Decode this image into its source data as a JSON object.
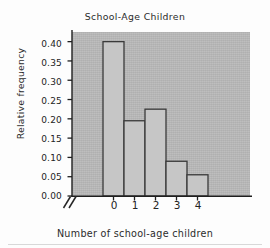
{
  "chart_data": {
    "type": "bar",
    "title": "School-Age Children",
    "xlabel": "Number of school-age children",
    "ylabel": "Relative frequency",
    "categories": [
      "0",
      "1",
      "2",
      "3",
      "4"
    ],
    "values": [
      0.4,
      0.195,
      0.225,
      0.09,
      0.055
    ],
    "ylim": [
      0.0,
      0.425
    ],
    "yticks": [
      "0.00",
      "0.05",
      "0.10",
      "0.15",
      "0.20",
      "0.25",
      "0.30",
      "0.35",
      "0.40"
    ],
    "ytick_values": [
      0.0,
      0.05,
      0.1,
      0.15,
      0.2,
      0.25,
      0.3,
      0.35,
      0.4
    ],
    "xticks": [
      "0",
      "1",
      "2",
      "3",
      "4"
    ],
    "grid": false,
    "legend": null,
    "axis_break": "//",
    "bar_style": "histogram-adjacent",
    "colors": {
      "panel_background": "#b9b9b9",
      "bar_fill": "#c6c6c6",
      "bar_edge": "#3a3a3a",
      "axis": "#1f1f1f",
      "text": "#242424",
      "figure_background": "#fdfdfd"
    }
  }
}
